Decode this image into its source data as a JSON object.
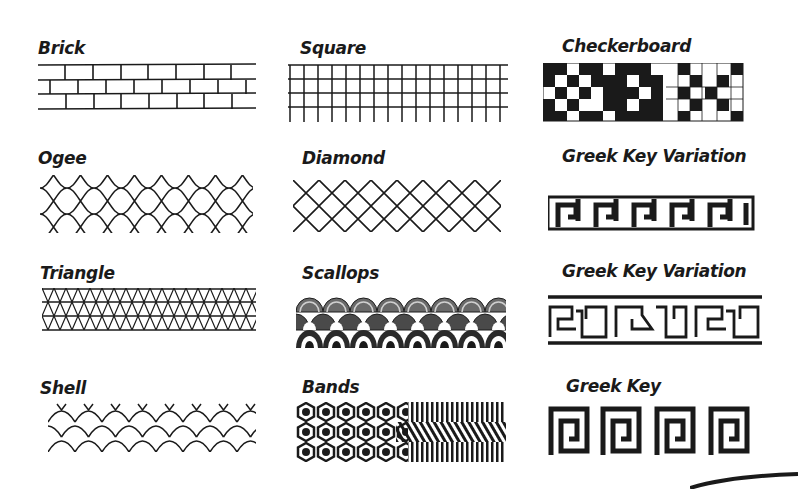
{
  "ink_color": "#1a1a1a",
  "background_color": "#ffffff",
  "patterns": [
    {
      "name": "Brick",
      "row": 1,
      "col": 1
    },
    {
      "name": "Square",
      "row": 1,
      "col": 2
    },
    {
      "name": "Checkerboard",
      "row": 1,
      "col": 3
    },
    {
      "name": "Ogee",
      "row": 2,
      "col": 1
    },
    {
      "name": "Diamond",
      "row": 2,
      "col": 2
    },
    {
      "name": "Greek Key Variation",
      "row": 2,
      "col": 3
    },
    {
      "name": "Triangle",
      "row": 3,
      "col": 1
    },
    {
      "name": "Scallops",
      "row": 3,
      "col": 2
    },
    {
      "name": "Greek Key Variation",
      "row": 3,
      "col": 3
    },
    {
      "name": "Shell",
      "row": 4,
      "col": 1
    },
    {
      "name": "Bands",
      "row": 4,
      "col": 2
    },
    {
      "name": "Greek Key",
      "row": 4,
      "col": 3
    }
  ]
}
